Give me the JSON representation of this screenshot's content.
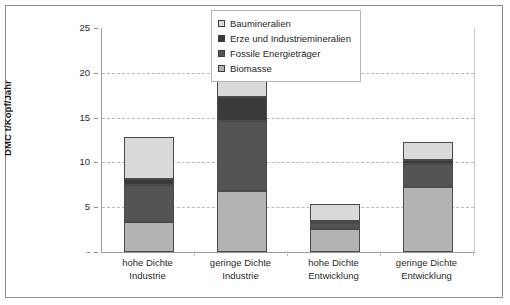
{
  "chart_data": {
    "type": "bar",
    "stacked": true,
    "title": "",
    "xlabel": "",
    "ylabel": "DMC t/Kopf/Jahr",
    "ylim": [
      0,
      25
    ],
    "yticks": [
      "-",
      "5",
      "10",
      "15",
      "20",
      "25"
    ],
    "ytick_values": [
      0,
      5,
      10,
      15,
      20,
      25
    ],
    "grid": "horizontal-dashed",
    "legend_position": "top-right-inside",
    "categories": [
      {
        "line1": "hohe Dichte",
        "line2": "Industrie"
      },
      {
        "line1": "geringe Dichte",
        "line2": "Industrie"
      },
      {
        "line1": "hohe Dichte",
        "line2": "Entwicklung"
      },
      {
        "line1": "geringe Dichte",
        "line2": "Entwicklung"
      }
    ],
    "category_labels": [
      "hohe Dichte Industrie",
      "geringe Dichte Industrie",
      "hohe Dichte Entwicklung",
      "geringe Dichte Entwicklung"
    ],
    "series": [
      {
        "name": "Biomasse",
        "color": "#b3b3b3",
        "values": [
          3.3,
          6.8,
          2.6,
          7.3
        ]
      },
      {
        "name": "Fossile Energieträger",
        "color": "#545454",
        "values": [
          4.2,
          7.8,
          0.6,
          2.5
        ]
      },
      {
        "name": "Erze und Industriemineralien",
        "color": "#3a3a3a",
        "values": [
          0.6,
          2.7,
          0.3,
          0.5
        ]
      },
      {
        "name": "Baumineralien",
        "color": "#d9d9d9",
        "values": [
          4.7,
          6.2,
          1.9,
          2.0
        ]
      }
    ],
    "totals": [
      12.8,
      23.5,
      5.4,
      12.3
    ],
    "stack_order_bottom_to_top": [
      "Biomasse",
      "Fossile Energieträger",
      "Erze und Industriemineralien",
      "Baumineralien"
    ]
  },
  "legend": {
    "entries": [
      {
        "label": "Baumineralien",
        "color": "#d9d9d9"
      },
      {
        "label": "Erze und Industriemineralien",
        "color": "#3a3a3a"
      },
      {
        "label": "Fossile Energieträger",
        "color": "#545454"
      },
      {
        "label": "Biomasse",
        "color": "#b3b3b3"
      }
    ]
  }
}
